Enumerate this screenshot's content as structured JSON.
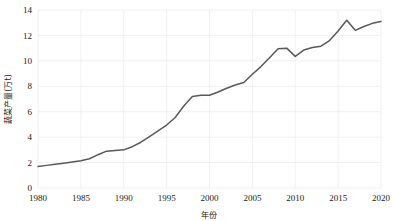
{
  "chart_data": {
    "type": "line",
    "title": "",
    "xlabel": "年份",
    "ylabel": "蔬菜产量(万t)",
    "xlim": [
      1980,
      2020
    ],
    "ylim": [
      0,
      14
    ],
    "grid": true,
    "legend": false,
    "line_color": "#595959",
    "grid_color": "#e8e8e8",
    "text_color": "#1a1a1a",
    "xticks": [
      1980,
      1985,
      1990,
      1995,
      2000,
      2005,
      2010,
      2015,
      2020
    ],
    "xtick_labels": [
      "1980",
      "1985",
      "1990",
      "1995",
      "2000",
      "2005",
      "2010",
      "2015",
      "2020"
    ],
    "yticks": [
      0,
      2,
      4,
      6,
      8,
      10,
      12,
      14
    ],
    "ytick_labels": [
      "0",
      "2",
      "4",
      "6",
      "8",
      "10",
      "12",
      "14"
    ],
    "series": [
      {
        "name": "蔬菜产量",
        "x": [
          1980,
          1981,
          1982,
          1983,
          1984,
          1985,
          1986,
          1987,
          1988,
          1989,
          1990,
          1991,
          1992,
          1993,
          1994,
          1995,
          1996,
          1997,
          1998,
          1999,
          2000,
          2001,
          2002,
          2003,
          2004,
          2005,
          2006,
          2007,
          2008,
          2009,
          2010,
          2011,
          2012,
          2013,
          2014,
          2015,
          2016,
          2017,
          2018,
          2019,
          2020
        ],
        "values": [
          1.7,
          1.78,
          1.86,
          1.95,
          2.05,
          2.15,
          2.3,
          2.62,
          2.9,
          2.95,
          3.0,
          3.25,
          3.6,
          4.05,
          4.5,
          4.95,
          5.55,
          6.45,
          7.2,
          7.3,
          7.3,
          7.55,
          7.85,
          8.1,
          8.3,
          8.95,
          9.55,
          10.25,
          10.95,
          11.0,
          10.35,
          10.85,
          11.05,
          11.15,
          11.6,
          12.35,
          13.2,
          12.4,
          12.7,
          12.95,
          13.1
        ]
      }
    ]
  }
}
